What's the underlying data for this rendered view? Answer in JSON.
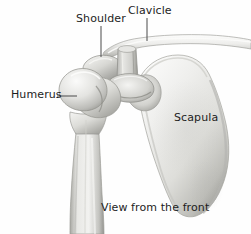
{
  "figure": {
    "caption": "View from the front",
    "background_color": "#fefefe",
    "label_color": "#1d1d1d",
    "leader_line_color": "#4a4a4a",
    "bone_colors": {
      "highlight": "#f2f2f0",
      "midtone": "#d8d8d5",
      "shadow": "#9a9a97",
      "deep_shadow": "#74746f",
      "outline": "#8f8f8b"
    }
  },
  "labels": {
    "shoulder": "Shoulder",
    "clavicle": "Clavicle",
    "humerus": "Humerus",
    "scapula": "Scapula",
    "caption": "View from the front"
  },
  "leader_lines": [
    {
      "name": "shoulder",
      "orientation": "vertical",
      "x1": 101,
      "y1": 26,
      "x2": 101,
      "y2": 57
    },
    {
      "name": "clavicle",
      "orientation": "vertical",
      "x1": 147,
      "y1": 18,
      "x2": 147,
      "y2": 41
    },
    {
      "name": "humerus",
      "orientation": "horizontal",
      "x1": 57,
      "y1": 96,
      "x2": 77,
      "y2": 96
    }
  ],
  "structures": [
    {
      "name": "clavicle",
      "description": "Long slender collarbone running horizontally across the upper figure from the acromion to the right edge"
    },
    {
      "name": "acromion",
      "description": "Flattened shell-like lateral projection of the scapular spine at the shoulder tip"
    },
    {
      "name": "coracoid",
      "description": "Vertical column-like process projecting anteriorly between the clavicle and glenoid"
    },
    {
      "name": "humerus",
      "description": "Upper arm bone with rounded head, greater tubercle and tapering shaft exiting the bottom edge"
    },
    {
      "name": "scapula",
      "description": "Large triangular shoulder blade tapering to an inferior angle at the lower right"
    }
  ]
}
